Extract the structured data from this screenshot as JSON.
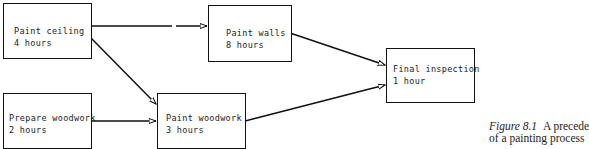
{
  "nodes": [
    {
      "id": "paint-ceiling",
      "name": "Paint ceiling",
      "duration": "4 hours"
    },
    {
      "id": "paint-walls",
      "name": "Paint walls",
      "duration": "8 hours"
    },
    {
      "id": "prepare-woodwork",
      "name": "Prepare woodwork",
      "duration": "2 hours"
    },
    {
      "id": "paint-woodwork",
      "name": "Paint woodwork",
      "duration": "3 hours"
    },
    {
      "id": "final-inspection",
      "name": "Final inspection",
      "duration": "1 hour"
    }
  ],
  "edges": [
    {
      "from": "Paint ceiling",
      "to": "Paint walls"
    },
    {
      "from": "Paint ceiling",
      "to": "Paint woodwork"
    },
    {
      "from": "Prepare woodwork",
      "to": "Paint woodwork"
    },
    {
      "from": "Paint walls",
      "to": "Final inspection"
    },
    {
      "from": "Paint woodwork",
      "to": "Final inspection"
    }
  ],
  "caption": {
    "figure_label": "Figure 8.1",
    "line1": "A precede",
    "line2": "of a painting process"
  }
}
